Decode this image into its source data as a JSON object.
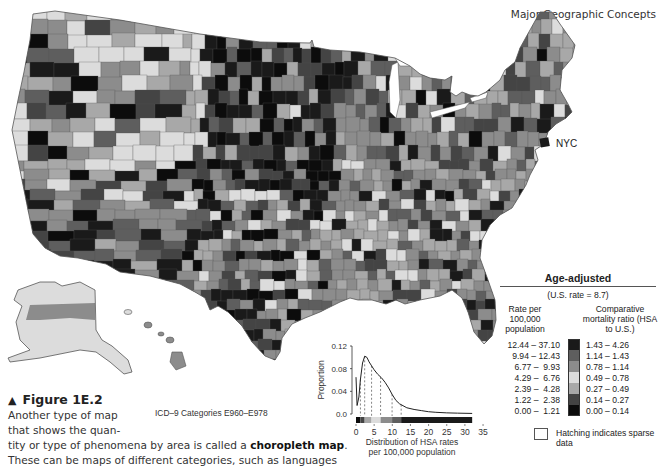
{
  "page": {
    "header": "Major Geographic Concepts",
    "figure_label": "Figure 1E.2",
    "figure_marker": "▲",
    "caption_lines": [
      "Another type of map",
      "that shows the quan-"
    ],
    "caption_full_prefix": "tity or type of phenomena by area is called a ",
    "caption_bold": "choropleth map",
    "caption_suffix": ".",
    "caption_cutoff": "These can be maps of different categories, such as languages",
    "icd_note": "ICD–9 Categories E960–E978"
  },
  "map": {
    "annotation_nyc": "NYC",
    "shades": [
      "#1a1a1a",
      "#5e5e5e",
      "#8c8c8c",
      "#dcdcdc",
      "#a8a8a8",
      "#444444",
      "#0c0c0c"
    ],
    "border_color": "#555555"
  },
  "legend": {
    "title": "Age-adjusted",
    "subtitle": "(U.S. rate = 8.7)",
    "rate_header": "Rate per 100,000 population",
    "ratio_header": "Comparative mortality ratio (HSA to U.S.)",
    "classes": [
      {
        "rate": "12.44 – 37.10",
        "ratio": "1.43 – 4.26",
        "color": "#1a1a1a"
      },
      {
        "rate": " 9.94 – 12.43",
        "ratio": "1.14 – 1.43",
        "color": "#5e5e5e"
      },
      {
        "rate": " 6.77 –  9.93",
        "ratio": "0.78 – 1.14",
        "color": "#8c8c8c"
      },
      {
        "rate": " 4.29 –  6.76",
        "ratio": "0.49 – 0.78",
        "color": "#dcdcdc"
      },
      {
        "rate": " 2.39 –  4.28",
        "ratio": "0.27 – 0.49",
        "color": "#a8a8a8"
      },
      {
        "rate": " 1.22 –  2.38",
        "ratio": "0.14 – 0.27",
        "color": "#444444"
      },
      {
        "rate": " 0.00 –  1.21",
        "ratio": "0.00 – 0.14",
        "color": "#0c0c0c"
      }
    ],
    "hatching_note": "Hatching indicates sparse data"
  },
  "chart_data": {
    "type": "line",
    "title": "",
    "xlabel": "Distribution of HSA rates per 100,000 population",
    "ylabel": "Proportion",
    "xlim": [
      0,
      35
    ],
    "ylim": [
      0,
      0.12
    ],
    "xticks": [
      0,
      5,
      10,
      15,
      20,
      25,
      30,
      35
    ],
    "yticks": [
      0.0,
      0.04,
      0.08,
      0.12
    ],
    "ytick_labels": [
      "0.0",
      "0.04",
      "0.08",
      "0.12"
    ],
    "x": [
      0,
      0.3,
      0.8,
      1.2,
      1.8,
      2.4,
      3.0,
      3.6,
      4.3,
      5.0,
      6.0,
      7.0,
      8.0,
      9.0,
      10.0,
      11.0,
      12.0,
      14.0,
      16.0,
      18.0,
      20.0,
      22.0,
      25.0,
      28.0,
      32.0
    ],
    "values": [
      0.065,
      0.015,
      0.03,
      0.06,
      0.09,
      0.102,
      0.1,
      0.092,
      0.085,
      0.078,
      0.07,
      0.064,
      0.056,
      0.046,
      0.034,
      0.024,
      0.018,
      0.011,
      0.008,
      0.006,
      0.004,
      0.003,
      0.002,
      0.0015,
      0.001
    ],
    "class_breaks_dashed": [
      1.22,
      2.39,
      4.29,
      6.77,
      9.94,
      12.44
    ],
    "colorbar": [
      {
        "from": 0,
        "to": 1.21,
        "color": "#0c0c0c"
      },
      {
        "from": 1.22,
        "to": 2.38,
        "color": "#444444"
      },
      {
        "from": 2.39,
        "to": 4.28,
        "color": "#a8a8a8"
      },
      {
        "from": 4.29,
        "to": 6.76,
        "color": "#dcdcdc"
      },
      {
        "from": 6.77,
        "to": 9.93,
        "color": "#8c8c8c"
      },
      {
        "from": 9.94,
        "to": 12.43,
        "color": "#5e5e5e"
      },
      {
        "from": 12.44,
        "to": 32.0,
        "color": "#1a1a1a"
      }
    ],
    "grid": false,
    "legend_position": "none"
  }
}
